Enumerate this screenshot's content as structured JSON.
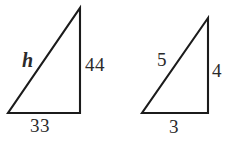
{
  "figure": {
    "background_color": "#ffffff",
    "stroke_color": "#1b1b1b",
    "text_color": "#2a2a2a",
    "triangles": [
      {
        "name": "large-triangle",
        "description": "Right triangle with unknown hypotenuse h, vertical leg 44, horizontal leg 33",
        "points": "8,113 80,113 80,8 8,113",
        "labels": {
          "hypotenuse": "h",
          "vertical_leg": "44",
          "horizontal_leg": "33"
        }
      },
      {
        "name": "small-triangle",
        "description": "Right triangle with hypotenuse 5, vertical leg 4, horizontal leg 3",
        "points": "142,113 208,113 208,18 142,113",
        "labels": {
          "hypotenuse": "5",
          "vertical_leg": "4",
          "horizontal_leg": "3"
        }
      }
    ]
  },
  "chart_data": {
    "type": "diagram",
    "shapes": [
      {
        "id": "large-triangle",
        "kind": "right-triangle",
        "vertices": [
          [
            8,
            113
          ],
          [
            80,
            113
          ],
          [
            80,
            8
          ]
        ],
        "side_labels": {
          "hypotenuse": "h",
          "opposite": "44",
          "adjacent": "33"
        }
      },
      {
        "id": "small-triangle",
        "kind": "right-triangle",
        "vertices": [
          [
            142,
            113
          ],
          [
            208,
            113
          ],
          [
            208,
            18
          ]
        ],
        "side_labels": {
          "hypotenuse": "5",
          "opposite": "4",
          "adjacent": "3"
        }
      }
    ],
    "annotations": [
      "h",
      "44",
      "33",
      "5",
      "4",
      "3"
    ]
  }
}
